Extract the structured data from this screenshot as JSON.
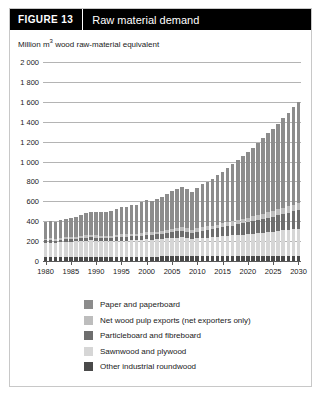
{
  "figure": {
    "tag": "FIGURE  13",
    "title": "Raw material demand",
    "subtitle_prefix": "Million m",
    "subtitle_sup": "3",
    "subtitle_suffix": " wood raw-material equivalent"
  },
  "legend": {
    "items": [
      {
        "label": "Paper and paperboard",
        "color": "#8c8c8c"
      },
      {
        "label": "Net wood pulp exports (net exporters only)",
        "color": "#bdbdbd"
      },
      {
        "label": "Particleboard and fibreboard",
        "color": "#6e6e6e"
      },
      {
        "label": "Sawnwood and plywood",
        "color": "#d6d6d6"
      },
      {
        "label": "Other industrial roundwood",
        "color": "#4a4a4a"
      }
    ]
  },
  "chart_data": {
    "type": "bar",
    "stacked": true,
    "title": "Raw material demand",
    "xlabel": "",
    "ylabel": "Million m3 wood raw-material equivalent",
    "ylim": [
      0,
      2000
    ],
    "ytick_labels": [
      "2 000",
      "1 800",
      "1 600",
      "1 400",
      "1 200",
      "1 000",
      "800",
      "600",
      "400",
      "200",
      "0"
    ],
    "yticks": [
      2000,
      1800,
      1600,
      1400,
      1200,
      1000,
      800,
      600,
      400,
      200,
      0
    ],
    "grid": true,
    "legend_position": "bottom",
    "xlim": [
      1980,
      2030
    ],
    "xtick_labels": [
      "1980",
      "1985",
      "1990",
      "1995",
      "2000",
      "2005",
      "2010",
      "2015",
      "2020",
      "2025",
      "2030"
    ],
    "xticks": [
      1980,
      1985,
      1990,
      1995,
      2000,
      2005,
      2010,
      2015,
      2020,
      2025,
      2030
    ],
    "categories": [
      1980,
      1981,
      1982,
      1983,
      1984,
      1985,
      1986,
      1987,
      1988,
      1989,
      1990,
      1991,
      1992,
      1993,
      1994,
      1995,
      1996,
      1997,
      1998,
      1999,
      2000,
      2001,
      2002,
      2003,
      2004,
      2005,
      2006,
      2007,
      2008,
      2009,
      2010,
      2011,
      2012,
      2013,
      2014,
      2015,
      2016,
      2017,
      2018,
      2019,
      2020,
      2021,
      2022,
      2023,
      2024,
      2025,
      2026,
      2027,
      2028,
      2029,
      2030
    ],
    "series": [
      {
        "name": "Other industrial roundwood",
        "color": "#4a4a4a",
        "values": [
          40,
          40,
          40,
          41,
          41,
          42,
          42,
          42,
          43,
          43,
          43,
          43,
          43,
          43,
          44,
          44,
          44,
          44,
          45,
          45,
          45,
          45,
          45,
          46,
          46,
          46,
          46,
          47,
          47,
          47,
          47,
          48,
          48,
          48,
          48,
          49,
          49,
          49,
          49,
          50,
          50,
          50,
          50,
          51,
          51,
          51,
          51,
          52,
          52,
          52,
          52
        ]
      },
      {
        "name": "Sawnwood and plywood",
        "color": "#d6d6d6",
        "values": [
          145,
          146,
          143,
          148,
          152,
          152,
          155,
          160,
          163,
          164,
          162,
          158,
          156,
          157,
          160,
          162,
          162,
          165,
          163,
          168,
          172,
          170,
          172,
          175,
          182,
          188,
          190,
          190,
          182,
          170,
          180,
          186,
          188,
          192,
          196,
          200,
          204,
          208,
          212,
          216,
          220,
          225,
          230,
          235,
          240,
          245,
          250,
          255,
          260,
          265,
          270
        ]
      },
      {
        "name": "Particleboard and fibreboard",
        "color": "#6e6e6e",
        "values": [
          22,
          23,
          23,
          24,
          25,
          26,
          27,
          29,
          30,
          31,
          31,
          31,
          31,
          32,
          34,
          36,
          37,
          39,
          40,
          43,
          46,
          47,
          50,
          53,
          57,
          61,
          65,
          68,
          66,
          62,
          68,
          72,
          76,
          80,
          85,
          90,
          95,
          100,
          106,
          112,
          118,
          124,
          130,
          137,
          144,
          151,
          158,
          166,
          174,
          182,
          190
        ]
      },
      {
        "name": "Net wood pulp exports (net exporters only)",
        "color": "#bdbdbd",
        "values": [
          18,
          18,
          18,
          19,
          19,
          20,
          20,
          21,
          21,
          22,
          22,
          22,
          22,
          23,
          24,
          25,
          25,
          26,
          26,
          27,
          28,
          28,
          29,
          30,
          31,
          32,
          33,
          34,
          33,
          32,
          34,
          35,
          36,
          37,
          38,
          39,
          41,
          42,
          44,
          45,
          47,
          49,
          51,
          53,
          55,
          57,
          59,
          61,
          64,
          66,
          69
        ]
      },
      {
        "name": "Paper and paperboard",
        "color": "#8c8c8c",
        "values": [
          168,
          171,
          170,
          179,
          190,
          194,
          203,
          215,
          226,
          234,
          238,
          240,
          244,
          251,
          264,
          276,
          280,
          292,
          294,
          308,
          322,
          318,
          328,
          340,
          358,
          373,
          390,
          404,
          396,
          378,
          410,
          430,
          450,
          472,
          496,
          520,
          546,
          574,
          602,
          630,
          660,
          692,
          724,
          758,
          792,
          828,
          864,
          902,
          940,
          980,
          1020
        ]
      }
    ]
  }
}
